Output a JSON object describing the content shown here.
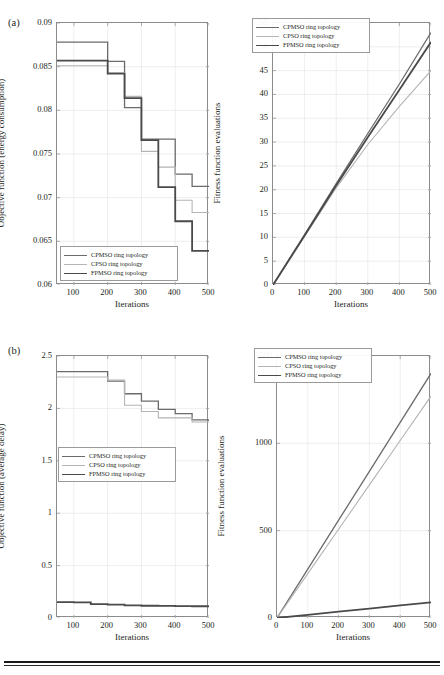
{
  "figure": {
    "panel_a_tag": "(a)",
    "panel_b_tag": "(b)"
  },
  "legend": {
    "series": [
      {
        "label": "CPMSO ring topology",
        "color": "#6b6b6b",
        "width": 1.3
      },
      {
        "label": "CPSO ring topology",
        "color": "#b4b4b4",
        "width": 1.1
      },
      {
        "label": "FPMSO ring topology",
        "color": "#4a4a4a",
        "width": 1.8
      }
    ]
  },
  "chart_data": [
    {
      "id": "a-left",
      "type": "line",
      "title": "",
      "xlabel": "Iterations",
      "ylabel": "Objective function (energy consumption)",
      "xlim": [
        50,
        500
      ],
      "ylim": [
        0.06,
        0.09
      ],
      "xticks": [
        100,
        200,
        300,
        400,
        500
      ],
      "yticks": [
        0.06,
        0.065,
        0.07,
        0.075,
        0.08,
        0.085,
        0.09
      ],
      "ytick_labels": [
        "0.06",
        "0.065",
        "0.07",
        "0.075",
        "0.08",
        "0.085",
        "0.09"
      ],
      "xtick_labels": [
        "100",
        "200",
        "300",
        "400",
        "500"
      ],
      "grid": true,
      "step": true,
      "legend_position": "lower-left",
      "series": [
        {
          "name": "CPMSO ring topology",
          "color": "#6b6b6b",
          "width": 1.3,
          "x": [
            50,
            150,
            200,
            250,
            300,
            350,
            400,
            450,
            500
          ],
          "y": [
            0.0878,
            0.0878,
            0.0856,
            0.0803,
            0.0767,
            0.0767,
            0.0727,
            0.0713,
            0.0713
          ]
        },
        {
          "name": "CPSO ring topology",
          "color": "#b4b4b4",
          "width": 1.1,
          "x": [
            50,
            150,
            200,
            250,
            300,
            350,
            400,
            450,
            500
          ],
          "y": [
            0.0851,
            0.0851,
            0.0843,
            0.0816,
            0.0753,
            0.0735,
            0.0697,
            0.0683,
            0.0683
          ]
        },
        {
          "name": "FPMSO ring topology",
          "color": "#4a4a4a",
          "width": 1.8,
          "x": [
            50,
            150,
            200,
            250,
            300,
            350,
            400,
            450,
            500
          ],
          "y": [
            0.0857,
            0.0857,
            0.0842,
            0.0814,
            0.0766,
            0.0712,
            0.0673,
            0.0639,
            0.0639
          ]
        }
      ]
    },
    {
      "id": "a-right",
      "type": "line",
      "title": "",
      "xlabel": "Iterations",
      "ylabel": "Fitness function evaluations",
      "xlim": [
        0,
        500
      ],
      "ylim": [
        0,
        55
      ],
      "xticks": [
        0,
        100,
        200,
        300,
        400,
        500
      ],
      "yticks": [
        0,
        5,
        10,
        15,
        20,
        25,
        30,
        35,
        40,
        45,
        50,
        55
      ],
      "ytick_labels": [
        "0",
        "5",
        "10",
        "15",
        "20",
        "25",
        "30",
        "35",
        "40",
        "45",
        "50",
        "55"
      ],
      "xtick_labels": [
        "0",
        "100",
        "200",
        "300",
        "400",
        "500"
      ],
      "grid": true,
      "step": false,
      "legend_position": "upper-left",
      "series": [
        {
          "name": "CPMSO ring topology",
          "color": "#6b6b6b",
          "width": 1.3,
          "x": [
            0,
            100,
            200,
            300,
            400,
            500
          ],
          "y": [
            0,
            10.6,
            21.3,
            31.8,
            42.2,
            53.0
          ]
        },
        {
          "name": "CPSO ring topology",
          "color": "#b4b4b4",
          "width": 1.1,
          "x": [
            0,
            100,
            200,
            300,
            400,
            500
          ],
          "y": [
            0,
            10.2,
            20.4,
            29.5,
            37.5,
            45.0
          ]
        },
        {
          "name": "FPMSO ring topology",
          "color": "#4a4a4a",
          "width": 1.8,
          "x": [
            0,
            100,
            200,
            300,
            400,
            500
          ],
          "y": [
            0,
            10.4,
            20.9,
            31.0,
            41.0,
            51.0
          ]
        }
      ]
    },
    {
      "id": "b-left",
      "type": "line",
      "title": "",
      "xlabel": "Iterations",
      "ylabel": "Objective function (average delay)",
      "xlim": [
        50,
        500
      ],
      "ylim": [
        0,
        2.5
      ],
      "xticks": [
        100,
        200,
        300,
        400,
        500
      ],
      "yticks": [
        0,
        0.5,
        1,
        1.5,
        2,
        2.5
      ],
      "ytick_labels": [
        "0",
        "0.5",
        "1",
        "1.5",
        "2",
        "2.5"
      ],
      "xtick_labels": [
        "100",
        "200",
        "300",
        "400",
        "500"
      ],
      "grid": true,
      "step": true,
      "legend_position": "middle-left",
      "series": [
        {
          "name": "CPMSO ring topology",
          "color": "#6b6b6b",
          "width": 1.3,
          "x": [
            50,
            150,
            200,
            250,
            300,
            350,
            400,
            450,
            500
          ],
          "y": [
            2.35,
            2.35,
            2.26,
            2.14,
            2.07,
            1.99,
            1.95,
            1.89,
            1.88
          ]
        },
        {
          "name": "CPSO ring topology",
          "color": "#b4b4b4",
          "width": 1.1,
          "x": [
            50,
            150,
            200,
            250,
            300,
            350,
            400,
            450,
            500
          ],
          "y": [
            2.3,
            2.3,
            2.27,
            2.03,
            1.97,
            1.91,
            1.91,
            1.87,
            1.87
          ]
        },
        {
          "name": "FPMSO ring topology",
          "color": "#4a4a4a",
          "width": 1.8,
          "x": [
            50,
            100,
            150,
            200,
            250,
            300,
            350,
            400,
            450,
            500
          ],
          "y": [
            0.152,
            0.15,
            0.133,
            0.127,
            0.12,
            0.117,
            0.115,
            0.113,
            0.112,
            0.112
          ]
        }
      ]
    },
    {
      "id": "b-right",
      "type": "line",
      "title": "",
      "xlabel": "Iterations",
      "ylabel": "Fitness function evaluations",
      "xlim": [
        0,
        500
      ],
      "ylim": [
        0,
        1500
      ],
      "xticks": [
        0,
        100,
        200,
        300,
        400,
        500
      ],
      "yticks": [
        0,
        500,
        1000,
        1500
      ],
      "ytick_labels": [
        "0",
        "500",
        "1000",
        "1500"
      ],
      "xtick_labels": [
        "0",
        "100",
        "200",
        "300",
        "400",
        "500"
      ],
      "grid": true,
      "step": false,
      "legend_position": "upper-left",
      "series": [
        {
          "name": "CPMSO ring topology",
          "color": "#6b6b6b",
          "width": 1.3,
          "x": [
            0,
            100,
            200,
            300,
            400,
            500
          ],
          "y": [
            0,
            280,
            560,
            840,
            1120,
            1400
          ]
        },
        {
          "name": "CPSO ring topology",
          "color": "#b4b4b4",
          "width": 1.1,
          "x": [
            0,
            100,
            200,
            300,
            400,
            500
          ],
          "y": [
            0,
            254,
            508,
            762,
            1016,
            1270
          ]
        },
        {
          "name": "FPMSO ring topology",
          "color": "#4a4a4a",
          "width": 1.8,
          "x": [
            0,
            100,
            200,
            300,
            400,
            500
          ],
          "y": [
            0,
            18,
            36,
            54,
            72,
            90
          ]
        }
      ]
    }
  ]
}
